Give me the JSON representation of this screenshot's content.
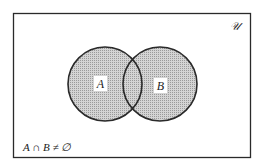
{
  "diagram": {
    "type": "venn",
    "universe_label": "𝒰",
    "sets": [
      {
        "id": "A",
        "label": "A"
      },
      {
        "id": "B",
        "label": "B"
      }
    ],
    "statement": "A ∩ B ≠ ∅",
    "shading": "all regions of A and B shaded",
    "colors": {
      "border": "#2a2a2a",
      "fill": "#bdbdbd",
      "background": "#ffffff"
    }
  }
}
